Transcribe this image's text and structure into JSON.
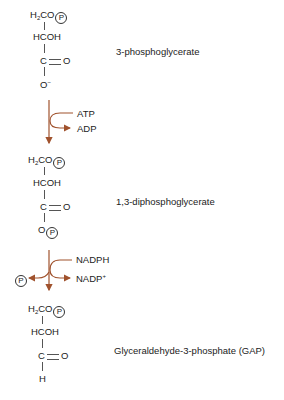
{
  "colors": {
    "arrow": "#a0522d",
    "text": "#222222"
  },
  "compounds": [
    {
      "name": "3-phosphoglycerate",
      "structure": {
        "row1": "H",
        "row1_sub": "2",
        "row1_rest": "CO",
        "phosphate": "P",
        "row2": "HCOH",
        "row3": "C",
        "row3_dbl": "O",
        "row4": "O",
        "row4_sup": "−"
      }
    },
    {
      "name": "1,3-diphosphoglycerate",
      "structure": {
        "row1": "H",
        "row1_sub": "2",
        "row1_rest": "CO",
        "phosphate": "P",
        "row2": "HCOH",
        "row3": "C",
        "row3_dbl": "O",
        "row4": "O",
        "row4_phosphate": "P"
      }
    },
    {
      "name": "Glyceraldehyde-3-phosphate (GAP)",
      "structure": {
        "row1": "H",
        "row1_sub": "2",
        "row1_rest": "CO",
        "phosphate": "P",
        "row2": "HCOH",
        "row3": "C",
        "row3_dbl": "O",
        "row4": "H"
      }
    }
  ],
  "reactions": [
    {
      "input": "ATP",
      "output": "ADP"
    },
    {
      "input": "NADPH",
      "output": "NADP",
      "output_sup": "+",
      "side_product": "P"
    }
  ]
}
